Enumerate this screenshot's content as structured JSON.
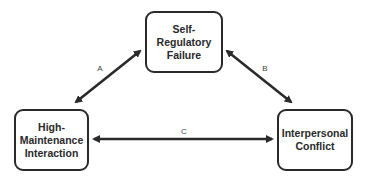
{
  "diagram": {
    "nodes": [
      {
        "id": "self-regulatory-failure",
        "label": "Self-\nRegulatory\nFailure"
      },
      {
        "id": "high-maintenance-interaction",
        "label": "High-\nMaintenance\nInteraction"
      },
      {
        "id": "interpersonal-conflict",
        "label": "Interpersonal\nConflict"
      }
    ],
    "edges": [
      {
        "label": "A",
        "from": "high-maintenance-interaction",
        "to": "self-regulatory-failure",
        "bidirectional": true
      },
      {
        "label": "B",
        "from": "self-regulatory-failure",
        "to": "interpersonal-conflict",
        "bidirectional": true
      },
      {
        "label": "C",
        "from": "high-maintenance-interaction",
        "to": "interpersonal-conflict",
        "bidirectional": true
      }
    ]
  }
}
